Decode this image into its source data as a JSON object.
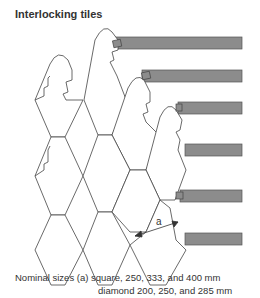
{
  "title": "Interlocking tiles",
  "dimension_label": "a",
  "caption": {
    "line1": "Nominal sizes (a) square, 250, 333, and 400 mm",
    "line2": "diamond 200, 250, and 285 mm"
  },
  "colors": {
    "bar_fill": "#8c8c8c",
    "bar_stroke": "#555555",
    "line": "#444444"
  }
}
